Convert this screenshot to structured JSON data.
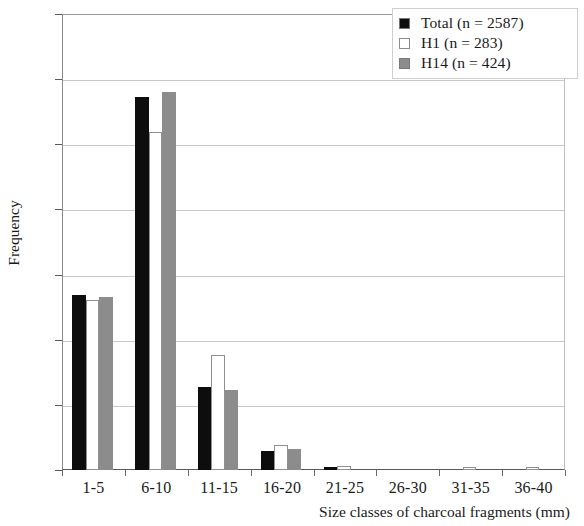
{
  "chart_data": {
    "type": "bar",
    "title": "",
    "xlabel": "Size classes of charcoal fragments (mm)",
    "ylabel": "Frequency",
    "categories": [
      "1-5",
      "6-10",
      "11-15",
      "16-20",
      "21-25",
      "26-30",
      "31-35",
      "36-40"
    ],
    "ylim": [
      0,
      70
    ],
    "yticks": [
      0,
      10,
      20,
      30,
      40,
      50,
      60,
      70
    ],
    "grid": "horizontal",
    "legend_position": "top-right",
    "series": [
      {
        "name": "Total (n = 2587)",
        "short_name": "Total",
        "color": "#0d0d0d",
        "values": [
          26.8,
          57.3,
          12.8,
          2.9,
          0.5,
          0,
          0,
          0
        ]
      },
      {
        "name": "H1 (n = 283)",
        "short_name": "H1",
        "color": "#ffffff",
        "values": [
          26.1,
          51.9,
          17.6,
          3.8,
          0.6,
          0,
          0.4,
          0.4
        ]
      },
      {
        "name": "H14 (n = 424)",
        "short_name": "H14",
        "color": "#8c8c8c",
        "values": [
          26.5,
          58.0,
          12.3,
          3.3,
          0,
          0,
          0,
          0
        ]
      }
    ]
  },
  "legend": {
    "entries": [
      {
        "label": "Total (n = 2587)",
        "swatch": "total"
      },
      {
        "label": "H1 (n = 283)",
        "swatch": "h1"
      },
      {
        "label": "H14 (n = 424)",
        "swatch": "h14"
      }
    ]
  },
  "axes": {
    "y_title": "Frequency",
    "x_title": "Size classes of charcoal fragments (mm)",
    "y_labels": [
      "70",
      "60",
      "50",
      "40",
      "30",
      "20",
      "10",
      "0"
    ],
    "x_labels": [
      "1-5",
      "6-10",
      "11-15",
      "16-20",
      "21-25",
      "26-30",
      "31-35",
      "36-40"
    ]
  }
}
